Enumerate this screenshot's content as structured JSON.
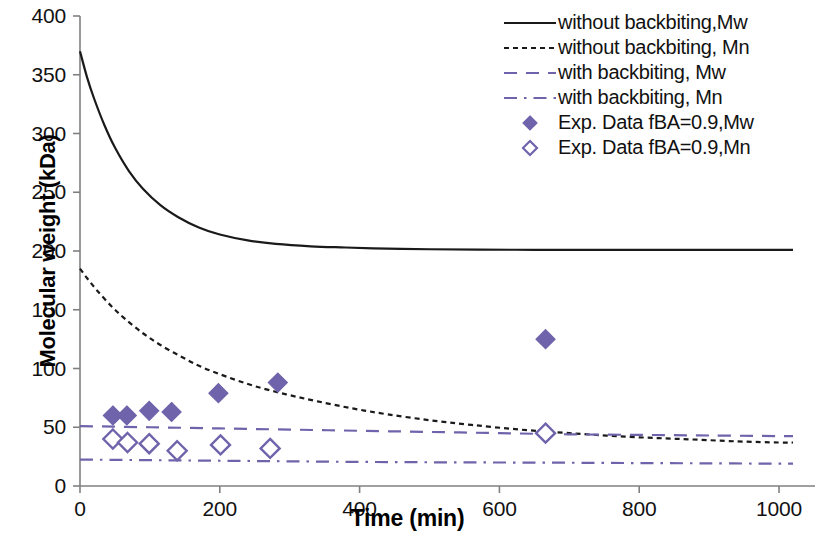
{
  "chart_data": {
    "type": "line",
    "title": "",
    "xlabel": "Time (min)",
    "ylabel": "Molecular weight (kDa)",
    "xlim": [
      0,
      1020
    ],
    "ylim": [
      0,
      400
    ],
    "xticks": [
      0,
      200,
      400,
      600,
      800,
      1000
    ],
    "yticks": [
      0,
      50,
      100,
      150,
      200,
      250,
      300,
      350,
      400
    ],
    "grid": false,
    "legend_position": "top-right",
    "colors": {
      "model_black": "#1a1a1a",
      "model_purple": "#6f63ab",
      "marker_purple": "#6f63ab",
      "axis": "#808080"
    },
    "series": [
      {
        "name": "without backbiting,Mw",
        "style": "solid",
        "color": "#1a1a1a",
        "x": [
          0,
          10,
          20,
          35,
          50,
          70,
          90,
          115,
          140,
          170,
          200,
          240,
          280,
          330,
          380,
          440,
          500,
          570,
          650,
          730,
          820,
          910,
          1000,
          1020
        ],
        "y": [
          370,
          348,
          330,
          307,
          288,
          268,
          253,
          239,
          229,
          220,
          214,
          209,
          206,
          204,
          203,
          202,
          201.5,
          201.2,
          201,
          201,
          201,
          201,
          201,
          201
        ]
      },
      {
        "name": "without backbiting, Mn",
        "style": "dotted",
        "color": "#1a1a1a",
        "x": [
          0,
          10,
          25,
          45,
          65,
          90,
          115,
          145,
          175,
          210,
          250,
          295,
          340,
          390,
          440,
          500,
          560,
          630,
          700,
          780,
          860,
          940,
          1000,
          1020
        ],
        "y": [
          185,
          177,
          166,
          153,
          142,
          130,
          120,
          110,
          101,
          93,
          85,
          78,
          72,
          66,
          61,
          56,
          52,
          48,
          45,
          42,
          40,
          38,
          37,
          37
        ]
      },
      {
        "name": "with backbiting, Mw",
        "style": "dashed",
        "color": "#6f63ab",
        "x": [
          0,
          100,
          200,
          300,
          400,
          500,
          600,
          700,
          800,
          900,
          1000,
          1020
        ],
        "y": [
          51,
          50,
          49,
          48,
          47,
          46,
          45,
          44,
          43.5,
          43,
          42.5,
          42.5
        ]
      },
      {
        "name": "with backbiting, Mn",
        "style": "dashdot",
        "color": "#6f63ab",
        "x": [
          0,
          100,
          200,
          300,
          400,
          500,
          600,
          700,
          800,
          900,
          1000,
          1020
        ],
        "y": [
          22.5,
          22,
          21.5,
          21,
          20.5,
          20.2,
          20,
          19.8,
          19.5,
          19.3,
          19,
          19
        ]
      }
    ],
    "scatter": [
      {
        "name": "Exp. Data fBA=0.9,Mw",
        "marker": "filled-diamond",
        "color": "#6f63ab",
        "points": [
          {
            "x": 47,
            "y": 60
          },
          {
            "x": 67,
            "y": 60
          },
          {
            "x": 99,
            "y": 64
          },
          {
            "x": 131,
            "y": 63
          },
          {
            "x": 198,
            "y": 79
          },
          {
            "x": 283,
            "y": 88
          },
          {
            "x": 666,
            "y": 125
          }
        ]
      },
      {
        "name": "Exp. Data fBA=0.9,Mn",
        "marker": "open-diamond",
        "color": "#6f63ab",
        "points": [
          {
            "x": 47,
            "y": 40
          },
          {
            "x": 68,
            "y": 37
          },
          {
            "x": 99,
            "y": 36
          },
          {
            "x": 139,
            "y": 30
          },
          {
            "x": 201,
            "y": 35
          },
          {
            "x": 272,
            "y": 32
          },
          {
            "x": 666,
            "y": 45
          }
        ]
      }
    ]
  },
  "axes": {
    "y_title": "Molecular weight (kDa)",
    "x_title": "Time (min)",
    "y_tick_labels": [
      "400",
      "350",
      "300",
      "250",
      "200",
      "150",
      "100",
      "50",
      "0"
    ],
    "x_tick_labels": [
      "0",
      "200",
      "400",
      "600",
      "800",
      "1000"
    ]
  },
  "legend": {
    "items": [
      {
        "label": "without backbiting,Mw",
        "kind": "line",
        "style": "solid",
        "color": "#1a1a1a"
      },
      {
        "label": "without backbiting, Mn",
        "kind": "line",
        "style": "dotted",
        "color": "#1a1a1a"
      },
      {
        "label": "with backbiting, Mw",
        "kind": "line",
        "style": "dashed",
        "color": "#6f63ab"
      },
      {
        "label": "with backbiting, Mn",
        "kind": "line",
        "style": "dashdot",
        "color": "#6f63ab"
      },
      {
        "label": "Exp. Data fBA=0.9,Mw",
        "kind": "marker",
        "style": "filled-diamond",
        "color": "#6f63ab"
      },
      {
        "label": "Exp. Data fBA=0.9,Mn",
        "kind": "marker",
        "style": "open-diamond",
        "color": "#6f63ab"
      }
    ]
  }
}
